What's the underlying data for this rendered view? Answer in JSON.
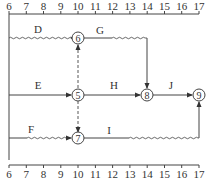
{
  "diagram": {
    "type": "time-scaled network (double-code time-coordinate network)",
    "time_axis": {
      "ticks": [
        "6",
        "7",
        "8",
        "9",
        "10",
        "11",
        "12",
        "13",
        "14",
        "15",
        "16",
        "17"
      ],
      "positions": [
        "top",
        "bottom"
      ]
    },
    "nodes": [
      {
        "id": "6",
        "label": "6",
        "time": 10
      },
      {
        "id": "5",
        "label": "5",
        "time": 10
      },
      {
        "id": "7",
        "label": "7",
        "time": 10
      },
      {
        "id": "8",
        "label": "8",
        "time": 14
      },
      {
        "id": "9",
        "label": "9",
        "time": 17
      }
    ],
    "activities": [
      {
        "label": "D",
        "from": "start",
        "to": "6",
        "start": 6,
        "end": 10,
        "style": "wavy (free float)"
      },
      {
        "label": "E",
        "from": "start",
        "to": "5",
        "start": 6,
        "end": 10,
        "style": "solid"
      },
      {
        "label": "F",
        "from": "start",
        "to": "7",
        "start": 6,
        "end": 10,
        "style": "wavy (free float)"
      },
      {
        "label": "G",
        "from": "6",
        "to": "8",
        "start": 10,
        "end": 14,
        "style": "solid then wavy"
      },
      {
        "label": "H",
        "from": "5",
        "to": "8",
        "start": 10,
        "end": 14,
        "style": "solid"
      },
      {
        "label": "J",
        "from": "8",
        "to": "9",
        "start": 14,
        "end": 17,
        "style": "solid"
      },
      {
        "label": "I",
        "from": "7",
        "to": "9",
        "start": 10,
        "end": 17,
        "style": "solid then wavy"
      }
    ],
    "dummies": [
      {
        "from": "5",
        "to": "6",
        "style": "dashed"
      },
      {
        "from": "5",
        "to": "7",
        "style": "dashed"
      }
    ]
  }
}
